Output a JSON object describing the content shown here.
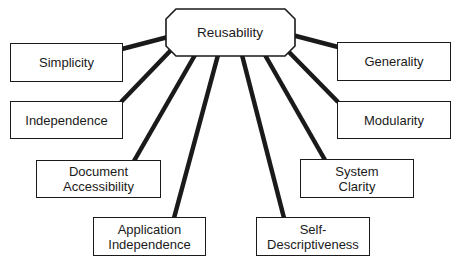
{
  "diagram": {
    "type": "hub-and-spoke",
    "center": {
      "id": "reusability",
      "label": "Reusability",
      "shape": "octagon"
    },
    "nodes": [
      {
        "id": "simplicity",
        "lines": [
          "Simplicity"
        ]
      },
      {
        "id": "independence",
        "lines": [
          "Independence"
        ]
      },
      {
        "id": "document-accessibility",
        "lines": [
          "Document",
          "Accessibility"
        ]
      },
      {
        "id": "application-independence",
        "lines": [
          "Application",
          "Independence"
        ]
      },
      {
        "id": "self-descriptiveness",
        "lines": [
          "Self-",
          "Descriptiveness"
        ]
      },
      {
        "id": "system-clarity",
        "lines": [
          "System",
          "Clarity"
        ]
      },
      {
        "id": "modularity",
        "lines": [
          "Modularity"
        ]
      },
      {
        "id": "generality",
        "lines": [
          "Generality"
        ]
      }
    ],
    "edges": [
      {
        "from": "reusability",
        "to": "simplicity"
      },
      {
        "from": "reusability",
        "to": "independence"
      },
      {
        "from": "reusability",
        "to": "document-accessibility"
      },
      {
        "from": "reusability",
        "to": "application-independence"
      },
      {
        "from": "reusability",
        "to": "self-descriptiveness"
      },
      {
        "from": "reusability",
        "to": "system-clarity"
      },
      {
        "from": "reusability",
        "to": "modularity"
      },
      {
        "from": "reusability",
        "to": "generality"
      }
    ],
    "colors": {
      "stroke": "#1a1a1a",
      "fill": "#ffffff"
    }
  }
}
